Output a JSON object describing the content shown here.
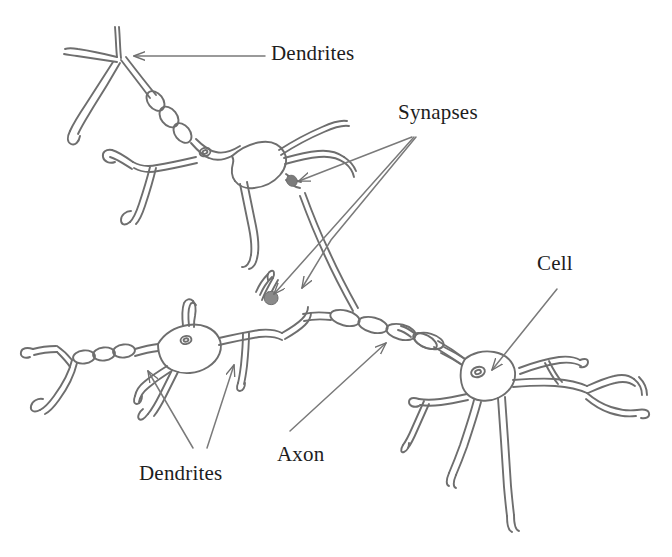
{
  "figure": {
    "type": "diagram",
    "background_color": "#ffffff",
    "ink_color": "#6b6b6b",
    "text_color": "#1d1d1d",
    "width": 672,
    "height": 557,
    "labels": [
      {
        "id": "dendrites-top",
        "text": "Dendrites",
        "x": 271,
        "y": 41
      },
      {
        "id": "synapses",
        "text": "Synapses",
        "x": 398,
        "y": 100
      },
      {
        "id": "cell",
        "text": "Cell",
        "x": 537,
        "y": 251
      },
      {
        "id": "axon",
        "text": "Axon",
        "x": 277,
        "y": 442
      },
      {
        "id": "dendrites-bottom",
        "text": "Dendrites",
        "x": 139,
        "y": 461
      }
    ],
    "leader_lines": [
      {
        "from_label": "dendrites-top",
        "points": "265,56 132,56",
        "arrow_at": "132,56"
      },
      {
        "from_label": "synapses",
        "points": "415,135 296,182",
        "arrow_at": "296,182"
      },
      {
        "from_label": "synapses",
        "points": "415,135 272,296",
        "arrow_at": "272,296"
      },
      {
        "from_label": "synapses",
        "points": "415,135 330,241 300,290",
        "arrow_at": "300,290"
      },
      {
        "from_label": "cell",
        "points": "557,288 490,372",
        "arrow_at": "490,372"
      },
      {
        "from_label": "axon",
        "points": "290,432 388,341",
        "arrow_at": "388,341"
      },
      {
        "from_label": "dendrites-bottom",
        "points": "193,449 146,369",
        "arrow_at": "146,369"
      },
      {
        "from_label": "dendrites-bottom",
        "points": "206,449 235,363",
        "arrow_at": "235,363"
      }
    ]
  }
}
